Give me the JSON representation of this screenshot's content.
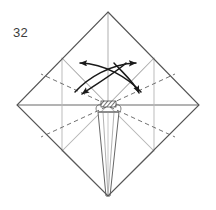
{
  "figure": {
    "step_number": "32",
    "caption": "",
    "type": "origami-fold-diagram",
    "canvas": {
      "width": 216,
      "height": 210,
      "background": "#ffffff"
    }
  },
  "colors": {
    "outline": "#555555",
    "crease_gray": "#b3b3b3",
    "dashed": "#6b6b6b",
    "arrow": "#1a1a1a",
    "hatch": "#3a3a3a",
    "text": "#3c3c3c",
    "paper_fill": "#ffffff"
  },
  "geometry": {
    "vertices": {
      "top": [
        108,
        12
      ],
      "left": [
        17,
        105
      ],
      "right": [
        199,
        105
      ],
      "bottom": [
        108,
        196
      ],
      "center": [
        108,
        105
      ],
      "mid_top_left": [
        62,
        58
      ],
      "mid_top_right": [
        154,
        58
      ],
      "mid_bottom_left": [
        62,
        151
      ],
      "mid_bottom_right": [
        154,
        151
      ]
    },
    "flap": {
      "top_left": [
        98,
        112
      ],
      "top_right": [
        119,
        112
      ],
      "apex": [
        108,
        196
      ]
    },
    "hatch_rect": {
      "x": 101,
      "y": 101,
      "width": 15,
      "height": 6
    }
  },
  "lines": {
    "outline_label": "diamond-outline",
    "solid_creases": [
      {
        "name": "center-to-bottom-left-edge",
        "from": "center",
        "to": "mid_bottom_left"
      },
      {
        "name": "center-to-bottom-right-edge",
        "from": "center",
        "to": "mid_bottom_right"
      }
    ],
    "gray_creases": [
      {
        "name": "center-to-top-vertex",
        "from": [
          108,
          105
        ],
        "to": [
          108,
          12
        ]
      },
      {
        "name": "center-to-mid-top-left",
        "from": [
          108,
          105
        ],
        "to": [
          62,
          58
        ]
      },
      {
        "name": "center-to-mid-top-right",
        "from": [
          108,
          105
        ],
        "to": [
          154,
          58
        ]
      },
      {
        "name": "center-to-mid-bottom-left",
        "from": [
          108,
          105
        ],
        "to": [
          62,
          151
        ]
      },
      {
        "name": "center-to-mid-bottom-right",
        "from": [
          108,
          105
        ],
        "to": [
          154,
          151
        ]
      },
      {
        "name": "horizontal-left-axis",
        "from": [
          17,
          105
        ],
        "to": [
          108,
          105
        ]
      },
      {
        "name": "horizontal-right-axis",
        "from": [
          108,
          105
        ],
        "to": [
          199,
          105
        ]
      }
    ],
    "dashed_creases": [
      {
        "name": "dashed-upper-left",
        "from": [
          108,
          105
        ],
        "to": [
          45,
          76
        ]
      },
      {
        "name": "dashed-upper-right",
        "from": [
          108,
          105
        ],
        "to": [
          171,
          76
        ]
      },
      {
        "name": "dashed-lower-left",
        "from": [
          108,
          105
        ],
        "to": [
          45,
          134
        ]
      },
      {
        "name": "dashed-lower-right",
        "from": [
          108,
          105
        ],
        "to": [
          171,
          134
        ]
      },
      {
        "name": "dashed-flap-left",
        "from": [
          98,
          112
        ],
        "to": [
          60,
          112
        ]
      },
      {
        "name": "dashed-flap-right",
        "from": [
          119,
          112
        ],
        "to": [
          157,
          112
        ]
      }
    ]
  },
  "arrows": [
    {
      "name": "arrow-curved-to-upper-left",
      "label": "unfold-left",
      "direction": "left",
      "start": [
        140,
        90
      ],
      "end": [
        78,
        63
      ],
      "head_angle_deg": 195
    },
    {
      "name": "arrow-curved-to-upper-right",
      "label": "unfold-right",
      "direction": "right",
      "start": [
        76,
        90
      ],
      "end": [
        138,
        63
      ],
      "head_angle_deg": -15
    },
    {
      "name": "arrow-curved-to-lower-left",
      "label": "fold-down-left",
      "direction": "down-left",
      "start": [
        124,
        62
      ],
      "end": [
        80,
        96
      ],
      "head_angle_deg": 140
    },
    {
      "name": "arrow-curved-to-lower-right",
      "label": "fold-down-right",
      "direction": "down-right",
      "start": [
        116,
        62
      ],
      "end": [
        140,
        96
      ],
      "head_angle_deg": 70
    }
  ]
}
